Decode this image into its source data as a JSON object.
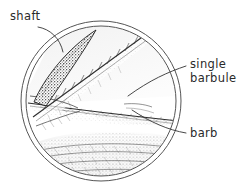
{
  "figure": {
    "background_color": "#ffffff",
    "ink_color": "#333333",
    "style": "pen-and-ink hand-drawn scientific illustration"
  },
  "frame": {
    "shape": "double-ring-circle",
    "center_x": 101,
    "center_y": 101,
    "outer_radius": 80,
    "inner_radius": 75,
    "stroke_color": "#555555"
  },
  "labels": [
    {
      "id": "shaft",
      "text": "shaft",
      "x": 10,
      "y": 20,
      "anchor": "start",
      "points_to": "dark stippled wedge at upper left"
    },
    {
      "id": "single-barbule-line1",
      "text": "single",
      "x": 190,
      "y": 68,
      "anchor": "start",
      "points_to": "fine barbule filament at center"
    },
    {
      "id": "single-barbule-line2",
      "text": "barbule",
      "x": 190,
      "y": 82,
      "anchor": "start",
      "points_to": "fine barbule filament at center"
    },
    {
      "id": "barb",
      "text": "barb",
      "x": 190,
      "y": 137,
      "anchor": "start",
      "points_to": "central horizontal barb rachis"
    }
  ],
  "structures": [
    {
      "id": "shaft-wedge",
      "name": "shaft",
      "description": "dark stippled lens-shaped wedge running diagonally in upper-left of the circle",
      "tone": "dark"
    },
    {
      "id": "upper-barb",
      "name": "upper barb",
      "description": "diagonal barb with toothed barbules along its upper edge running from lower-left to upper-right",
      "tone": "medium"
    },
    {
      "id": "central-barb",
      "name": "barb",
      "description": "roughly horizontal barb across the middle with fine feathery barbule hatching",
      "tone": "light"
    },
    {
      "id": "lower-vane",
      "name": "lower vane",
      "description": "dense stippled and hatched barbule mass filling the bottom of the circle",
      "tone": "dark-textured"
    }
  ]
}
